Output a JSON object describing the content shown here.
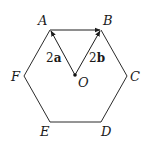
{
  "figure": {
    "type": "regular hexagon with vectors",
    "stroke_color": "#2b2b2b",
    "background": "#ffffff"
  },
  "vertices": {
    "A": {
      "label": "A",
      "x": 50,
      "y": 30
    },
    "B": {
      "label": "B",
      "x": 101,
      "y": 30
    },
    "C": {
      "label": "C",
      "x": 127,
      "y": 76
    },
    "D": {
      "label": "D",
      "x": 101,
      "y": 122
    },
    "E": {
      "label": "E",
      "x": 50,
      "y": 122
    },
    "F": {
      "label": "F",
      "x": 24,
      "y": 76
    }
  },
  "center": {
    "label": "O",
    "x": 75,
    "y": 75
  },
  "vectors": [
    {
      "from": "O",
      "to": "A",
      "coef": "2",
      "name": "a",
      "label": "2a"
    },
    {
      "from": "O",
      "to": "B",
      "coef": "2",
      "name": "b",
      "label": "2b"
    },
    {
      "from": "A",
      "to": "B",
      "label": ""
    }
  ]
}
